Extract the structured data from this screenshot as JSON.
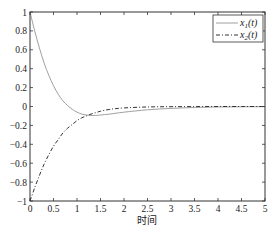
{
  "chart_data": {
    "type": "line",
    "title": "",
    "xlabel": "时间",
    "ylabel": "",
    "xlim": [
      0,
      5
    ],
    "ylim": [
      -1,
      1
    ],
    "xticks": [
      0,
      0.5,
      1,
      1.5,
      2,
      2.5,
      3,
      3.5,
      4,
      4.5,
      5
    ],
    "xtick_labels": [
      "0",
      "0.5",
      "1",
      "1.5",
      "2",
      "2.5",
      "3",
      "3.5",
      "4",
      "4.5",
      "5"
    ],
    "yticks": [
      1,
      0.8,
      0.6,
      0.4,
      0.2,
      0,
      -0.2,
      -0.4,
      -0.6,
      -0.8,
      -1
    ],
    "ytick_labels": [
      "1",
      "0.8",
      "0.6",
      "0.4",
      "0.2",
      "0",
      "−0.2",
      "−0.4",
      "−0.6",
      "−0.8",
      "−1"
    ],
    "grid": false,
    "legend_position": "upper right",
    "series": [
      {
        "name": "x1(t)",
        "label_base": "x",
        "label_sub": "1",
        "label_arg": "(t)",
        "style": "solid",
        "color": "#a0a0a0",
        "x": [
          0,
          0.1,
          0.2,
          0.3,
          0.4,
          0.5,
          0.6,
          0.7,
          0.8,
          0.9,
          1.0,
          1.1,
          1.2,
          1.3,
          1.4,
          1.5,
          1.7,
          2.0,
          2.5,
          3.0,
          3.5,
          4.0,
          4.5,
          5.0
        ],
        "values": [
          1.0,
          0.8,
          0.62,
          0.46,
          0.33,
          0.22,
          0.13,
          0.06,
          0.01,
          -0.03,
          -0.06,
          -0.08,
          -0.09,
          -0.095,
          -0.095,
          -0.09,
          -0.08,
          -0.06,
          -0.035,
          -0.02,
          -0.01,
          -0.005,
          -0.003,
          -0.002
        ]
      },
      {
        "name": "x2(t)",
        "label_base": "x",
        "label_sub": "2",
        "label_arg": "(t)",
        "style": "dashdot",
        "color": "#333333",
        "x": [
          0,
          0.1,
          0.2,
          0.3,
          0.4,
          0.5,
          0.6,
          0.7,
          0.8,
          0.9,
          1.0,
          1.1,
          1.2,
          1.3,
          1.4,
          1.5,
          1.7,
          2.0,
          2.5,
          3.0,
          3.5,
          4.0,
          4.5,
          5.0
        ],
        "values": [
          -1.0,
          -0.86,
          -0.73,
          -0.61,
          -0.51,
          -0.42,
          -0.35,
          -0.28,
          -0.23,
          -0.19,
          -0.15,
          -0.12,
          -0.1,
          -0.08,
          -0.065,
          -0.05,
          -0.03,
          -0.015,
          -0.005,
          -0.002,
          -0.001,
          0.0,
          0.0,
          0.0
        ]
      }
    ]
  },
  "axis": {
    "xlabel": "时间"
  },
  "legend": {
    "items": [
      {
        "base": "x",
        "sub": "1",
        "arg": "(t)"
      },
      {
        "base": "x",
        "sub": "2",
        "arg": "(t)"
      }
    ]
  }
}
